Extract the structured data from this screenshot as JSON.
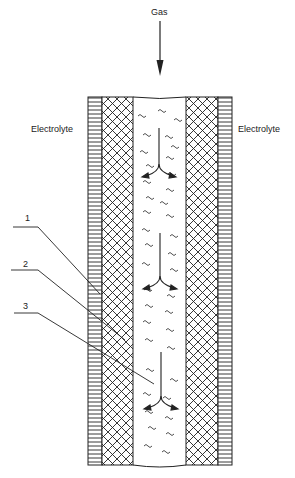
{
  "diagram": {
    "gas_label": "Gas",
    "left_label": "Electrolyte",
    "right_label": "Electrolyte",
    "callouts": [
      "1",
      "2",
      "3"
    ],
    "colors": {
      "ink": "#222222",
      "background": "#ffffff"
    }
  }
}
